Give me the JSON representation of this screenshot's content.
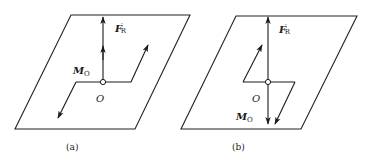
{
  "figure": {
    "panels": [
      {
        "id": "a",
        "caption": "(a)",
        "force_label": "F",
        "force_sub": "R",
        "force_prime": "′",
        "moment_label": "M",
        "moment_sub": "O",
        "origin_label": "O",
        "description": "Resultant force F'R perpendicular to plane; moment couple MO drawn in plane"
      },
      {
        "id": "b",
        "caption": "(b)",
        "force_label": "F",
        "force_sub": "R",
        "force_prime": "′",
        "moment_label": "M",
        "moment_sub": "O",
        "origin_label": "O",
        "description": "Resultant force F'R and moment MO along same line through O"
      }
    ],
    "colors": {
      "line": "#1a1a1a",
      "background": "#ffffff"
    }
  }
}
